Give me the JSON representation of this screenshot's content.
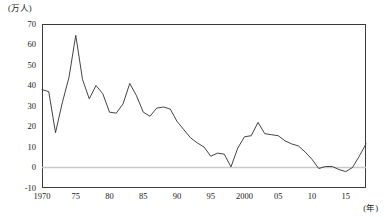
{
  "chart_data": {
    "type": "line",
    "title": "",
    "subtitle": "",
    "xlabel": "(年)",
    "ylabel": "(万人)",
    "ylim": [
      -10,
      70
    ],
    "xlim": [
      1970,
      2018
    ],
    "grid": false,
    "legend": null,
    "zero_line": 0,
    "y_ticks": [
      70,
      60,
      50,
      40,
      30,
      20,
      10,
      0,
      -10
    ],
    "x_ticks": [
      {
        "value": 1970,
        "label": "1970"
      },
      {
        "value": 1975,
        "label": "75"
      },
      {
        "value": 1980,
        "label": "80"
      },
      {
        "value": 1985,
        "label": "85"
      },
      {
        "value": 1990,
        "label": "90"
      },
      {
        "value": 1995,
        "label": "95"
      },
      {
        "value": 2000,
        "label": "2000"
      },
      {
        "value": 2005,
        "label": "05"
      },
      {
        "value": 2010,
        "label": "10"
      },
      {
        "value": 2015,
        "label": "15"
      }
    ],
    "series": [
      {
        "name": "",
        "color": "#3a3a3a",
        "x": [
          1970,
          1971,
          1972,
          1973,
          1974,
          1975,
          1976,
          1977,
          1978,
          1979,
          1980,
          1981,
          1982,
          1983,
          1984,
          1985,
          1986,
          1987,
          1988,
          1989,
          1990,
          1991,
          1992,
          1993,
          1994,
          1995,
          1996,
          1997,
          1998,
          1999,
          2000,
          2001,
          2002,
          2003,
          2004,
          2005,
          2006,
          2007,
          2008,
          2009,
          2010,
          2011,
          2012,
          2013,
          2014,
          2015,
          2016,
          2017,
          2018
        ],
        "values": [
          38.0,
          37.0,
          17.0,
          31.5,
          44.0,
          64.5,
          43.0,
          33.5,
          40.0,
          36.0,
          27.0,
          26.5,
          31.0,
          41.0,
          35.0,
          27.0,
          25.0,
          29.0,
          29.5,
          28.5,
          22.5,
          18.5,
          14.5,
          12.0,
          10.0,
          5.5,
          7.0,
          6.5,
          0.3,
          9.5,
          15.0,
          15.5,
          22.0,
          16.5,
          16.0,
          15.5,
          13.0,
          11.5,
          10.5,
          7.5,
          4.0,
          -0.5,
          0.5,
          0.5,
          -1.0,
          -2.0,
          0.0,
          5.5,
          11.5
        ]
      }
    ]
  }
}
